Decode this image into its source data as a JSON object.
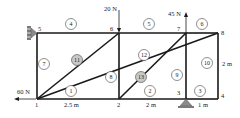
{
  "diagram": {
    "type": "truss",
    "nodes": [
      {
        "id": "1",
        "x": 37,
        "y": 99,
        "label_dx": -2,
        "label_dy": 8
      },
      {
        "id": "2",
        "x": 119,
        "y": 99,
        "label_dx": -2,
        "label_dy": 8
      },
      {
        "id": "3",
        "x": 186,
        "y": 99,
        "label_dx": -9,
        "label_dy": -4
      },
      {
        "id": "4",
        "x": 218,
        "y": 99,
        "label_dx": 3,
        "label_dy": -1
      },
      {
        "id": "5",
        "x": 37,
        "y": 33,
        "label_dx": 1,
        "label_dy": -2
      },
      {
        "id": "6",
        "x": 119,
        "y": 33,
        "label_dx": -9,
        "label_dy": -2
      },
      {
        "id": "7",
        "x": 186,
        "y": 33,
        "label_dx": -9,
        "label_dy": -2
      },
      {
        "id": "8",
        "x": 218,
        "y": 33,
        "label_dx": 3,
        "label_dy": 2
      }
    ],
    "members": [
      {
        "id": "1",
        "from": "1",
        "to": "2",
        "cx": 71,
        "cy": 91,
        "shaded": false
      },
      {
        "id": "2",
        "from": "2",
        "to": "3",
        "cx": 150,
        "cy": 91,
        "shaded": false
      },
      {
        "id": "3",
        "from": "3",
        "to": "4",
        "cx": 200,
        "cy": 91,
        "shaded": false
      },
      {
        "id": "4",
        "from": "5",
        "to": "6",
        "cx": 71,
        "cy": 24,
        "shaded": false
      },
      {
        "id": "5",
        "from": "6",
        "to": "7",
        "cx": 149,
        "cy": 24,
        "shaded": false
      },
      {
        "id": "6",
        "from": "7",
        "to": "8",
        "cx": 202,
        "cy": 24,
        "shaded": false
      },
      {
        "id": "7",
        "from": "1",
        "to": "5",
        "cx": 44,
        "cy": 64,
        "shaded": false
      },
      {
        "id": "8",
        "from": "2",
        "to": "6",
        "cx": 111,
        "cy": 77,
        "shaded": false
      },
      {
        "id": "9",
        "from": "3",
        "to": "7",
        "cx": 177,
        "cy": 75,
        "shaded": false
      },
      {
        "id": "10",
        "from": "4",
        "to": "8",
        "cx": 207,
        "cy": 63,
        "shaded": false
      },
      {
        "id": "11",
        "from": "1",
        "to": "6",
        "cx": 77,
        "cy": 60,
        "shaded": true
      },
      {
        "id": "12",
        "from": "1",
        "to": "8",
        "cx": 144,
        "cy": 55,
        "shaded": false
      },
      {
        "id": "13",
        "from": "2",
        "to": "7",
        "cx": 141,
        "cy": 77,
        "shaded": true
      }
    ],
    "loads": [
      {
        "label": "20 N",
        "node": "6",
        "direction": "down",
        "label_x": 104,
        "label_y": 11
      },
      {
        "label": "45 N",
        "node": "7",
        "direction": "up",
        "label_x": 168,
        "label_y": 16
      },
      {
        "label": "60 N",
        "node": "1",
        "direction": "left",
        "label_x": 17,
        "label_y": 94
      }
    ],
    "dimensions": [
      {
        "label": "2.5 m",
        "x": 64,
        "y": 107
      },
      {
        "label": "2 m",
        "x": 146,
        "y": 107
      },
      {
        "label": "1 m",
        "x": 198,
        "y": 107
      },
      {
        "label": "2 m",
        "x": 222,
        "y": 66
      }
    ],
    "supports": [
      {
        "type": "pin-wall",
        "node": "5"
      },
      {
        "type": "pin",
        "node": "3"
      }
    ],
    "colors": {
      "member": "#1a1a1a",
      "circle_shaded": "#c8c8c8",
      "support": "#8a8a8a"
    }
  }
}
